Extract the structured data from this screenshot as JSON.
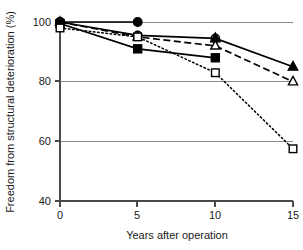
{
  "chart_data": {
    "type": "line",
    "title": "",
    "subtitle": "",
    "xlabel": "Years after operation",
    "ylabel": "Freedom from structural deterioration (%)",
    "x": [
      0,
      5,
      10,
      15
    ],
    "xlim": [
      0,
      15
    ],
    "ylim": [
      40,
      100
    ],
    "xticks": [
      "0",
      "5",
      "10",
      "15"
    ],
    "yticks": [
      "40",
      "60",
      "80",
      "100"
    ],
    "xtick_values": [
      0,
      5,
      10,
      15
    ],
    "ytick_values": [
      40,
      60,
      80,
      100
    ],
    "grid": "horizontal",
    "legend": "none",
    "legend_position": "none",
    "annotations": [],
    "series": [
      {
        "name": "filled-circle-series",
        "marker": "filled-circle",
        "linestyle": "solid",
        "color": "#000000",
        "x": [
          0,
          5
        ],
        "values": [
          100,
          100
        ]
      },
      {
        "name": "open-circle-series",
        "marker": "open-circle",
        "linestyle": "solid",
        "color": "#000000",
        "x": [
          0,
          5,
          10
        ],
        "values": [
          100,
          95.5,
          94.5
        ]
      },
      {
        "name": "filled-triangle-series",
        "marker": "filled-triangle",
        "linestyle": "solid",
        "color": "#000000",
        "x": [
          10,
          15
        ],
        "values": [
          94.5,
          85
        ]
      },
      {
        "name": "open-triangle-series",
        "marker": "open-triangle",
        "linestyle": "dashed",
        "color": "#000000",
        "x": [
          0,
          5,
          10,
          15
        ],
        "values": [
          100,
          95,
          92,
          80
        ]
      },
      {
        "name": "filled-square-series",
        "marker": "filled-square",
        "linestyle": "solid",
        "color": "#000000",
        "x": [
          0,
          5,
          10
        ],
        "values": [
          99.5,
          91,
          88
        ]
      },
      {
        "name": "open-square-series",
        "marker": "open-square",
        "linestyle": "dotted",
        "color": "#000000",
        "x": [
          0,
          5,
          10,
          15
        ],
        "values": [
          98,
          95,
          83,
          57.5
        ]
      }
    ]
  },
  "axes": {
    "y_axis_label": "Freedom from structural deterioration (%)",
    "x_axis_label": "Years after operation",
    "y_tick_labels": [
      "100",
      "80",
      "60",
      "40"
    ],
    "x_tick_labels": [
      "0",
      "5",
      "10",
      "15"
    ]
  },
  "colors": {
    "ink": "#000000",
    "grid": "#8a8a8a",
    "axis": "#4a4a4a",
    "background": "#ffffff"
  }
}
